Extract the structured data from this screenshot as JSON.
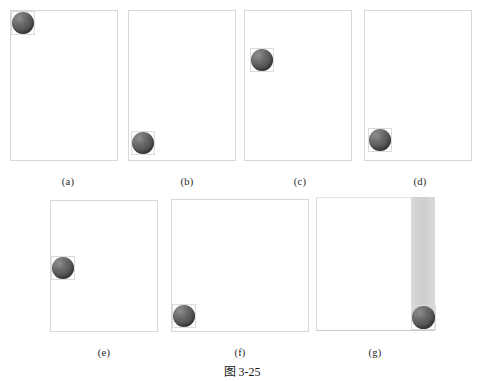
{
  "figure": {
    "caption_cn": "图",
    "caption_num": "3-25",
    "caption_full": "图 3-25",
    "background_color": "#ffffff",
    "frame_color": "#d8d8d8",
    "ball_color": "#565656",
    "bar_color": "#d4d4d4"
  },
  "panels": [
    {
      "id": "a",
      "label": "(a)",
      "frame": {
        "x": 10,
        "y": 10,
        "w": 108,
        "h": 151,
        "style": "box"
      },
      "ball": {
        "x": 11,
        "y": 11,
        "size": 24
      },
      "label_x": 68,
      "label_y": 176,
      "bar": null
    },
    {
      "id": "b",
      "label": "(b)",
      "frame": {
        "x": 128,
        "y": 10,
        "w": 108,
        "h": 151,
        "style": "box"
      },
      "ball": {
        "x": 131,
        "y": 131,
        "size": 24
      },
      "label_x": 187,
      "label_y": 176,
      "bar": null
    },
    {
      "id": "c",
      "label": "(c)",
      "frame": {
        "x": 244,
        "y": 10,
        "w": 108,
        "h": 151,
        "style": "box"
      },
      "ball": {
        "x": 250,
        "y": 48,
        "size": 24
      },
      "label_x": 300,
      "label_y": 176,
      "bar": null
    },
    {
      "id": "d",
      "label": "(d)",
      "frame": {
        "x": 364,
        "y": 10,
        "w": 108,
        "h": 151,
        "style": "box"
      },
      "ball": {
        "x": 368,
        "y": 128,
        "size": 24
      },
      "label_x": 420,
      "label_y": 176,
      "bar": null
    },
    {
      "id": "e",
      "label": "(e)",
      "frame": {
        "x": 50,
        "y": 200,
        "w": 108,
        "h": 132,
        "style": "box"
      },
      "ball": {
        "x": 51,
        "y": 256,
        "size": 24
      },
      "label_x": 104,
      "label_y": 347,
      "bar": null
    },
    {
      "id": "f",
      "label": "(f)",
      "frame": {
        "x": 171,
        "y": 199,
        "w": 138,
        "h": 133,
        "style": "box"
      },
      "ball": {
        "x": 172,
        "y": 304,
        "size": 24
      },
      "label_x": 240,
      "label_y": 347,
      "bar": null
    },
    {
      "id": "g",
      "label": "(g)",
      "frame": {
        "x": 316,
        "y": 197,
        "w": 119,
        "h": 134,
        "style": "open"
      },
      "ball": {
        "x": 411,
        "y": 305,
        "size": 25
      },
      "label_x": 375,
      "label_y": 347,
      "bar": {
        "x": 411,
        "y": 197,
        "w": 24,
        "h": 120
      }
    }
  ],
  "caption_position": {
    "x": 242,
    "y": 365
  }
}
